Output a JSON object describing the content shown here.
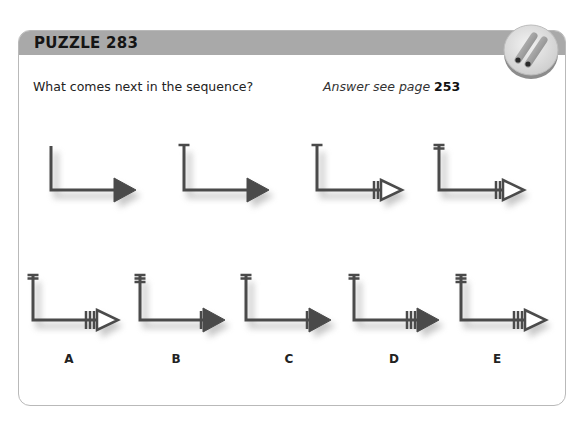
{
  "puzzle": {
    "title": "PUZZLE 283",
    "question": "What comes next in the sequence?",
    "answer_ref_prefix": "Answer see page",
    "answer_ref_page": "253"
  },
  "colors": {
    "header_bg": "#a9a9a9",
    "figure_stroke": "#4a4a4a",
    "figure_fill": "#4a4a4a",
    "hollow_fill": "#ffffff",
    "shadow": "#9a9a9a"
  },
  "sequence": [
    {
      "id": "seq-1",
      "top_bars": 0,
      "shaft_bars": 0,
      "triangle": "filled",
      "x": 40,
      "y": 140
    },
    {
      "id": "seq-2",
      "top_bars": 1,
      "shaft_bars": 0,
      "triangle": "filled",
      "x": 173,
      "y": 140
    },
    {
      "id": "seq-3",
      "top_bars": 1,
      "shaft_bars": 2,
      "triangle": "hollow",
      "x": 306,
      "y": 140
    },
    {
      "id": "seq-4",
      "top_bars": 2,
      "shaft_bars": 2,
      "triangle": "hollow",
      "x": 428,
      "y": 140
    }
  ],
  "options": [
    {
      "label": "A",
      "top_bars": 2,
      "shaft_bars": 3,
      "triangle": "hollow",
      "x": 22,
      "y": 270,
      "label_x": 59,
      "label_y": 352
    },
    {
      "label": "B",
      "top_bars": 3,
      "shaft_bars": 1,
      "triangle": "filled",
      "x": 129,
      "y": 270,
      "label_x": 166,
      "label_y": 352
    },
    {
      "label": "C",
      "top_bars": 2,
      "shaft_bars": 1,
      "triangle": "filled",
      "x": 235,
      "y": 270,
      "label_x": 279,
      "label_y": 352
    },
    {
      "label": "D",
      "top_bars": 2,
      "shaft_bars": 3,
      "triangle": "filled",
      "x": 343,
      "y": 270,
      "label_x": 384,
      "label_y": 352
    },
    {
      "label": "E",
      "top_bars": 3,
      "shaft_bars": 3,
      "triangle": "hollow",
      "x": 450,
      "y": 270,
      "label_x": 487,
      "label_y": 352
    }
  ]
}
